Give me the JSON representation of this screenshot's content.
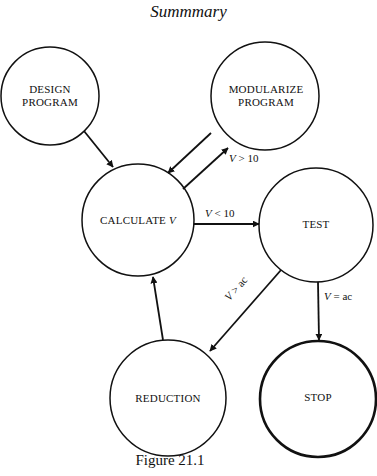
{
  "title": "Summmary",
  "caption": "Figure 21.1",
  "colors": {
    "stroke": "#111111",
    "background": "#ffffff"
  },
  "nodes": [
    {
      "id": "design",
      "lines": [
        "DESIGN",
        "PROGRAM"
      ],
      "cx": 50,
      "cy": 96,
      "r": 49,
      "stroke_width": 1.5
    },
    {
      "id": "modularize",
      "lines": [
        "MODULARIZE",
        "PROGRAM"
      ],
      "cx": 265,
      "cy": 96,
      "r": 54,
      "stroke_width": 1.5
    },
    {
      "id": "calculate",
      "lines": [
        "CALCULATE V"
      ],
      "cx": 138,
      "cy": 220,
      "r": 56,
      "stroke_width": 1.5
    },
    {
      "id": "test",
      "lines": [
        "TEST"
      ],
      "cx": 316,
      "cy": 225,
      "r": 57,
      "stroke_width": 1.5
    },
    {
      "id": "reduction",
      "lines": [
        "REDUCTION"
      ],
      "cx": 168,
      "cy": 398,
      "r": 58,
      "stroke_width": 1.5
    },
    {
      "id": "stop",
      "lines": [
        "STOP"
      ],
      "cx": 318,
      "cy": 399,
      "r": 58,
      "stroke_width": 2.6
    }
  ],
  "edges": [
    {
      "from": "design",
      "to": "calculate",
      "label": "",
      "x1": 84,
      "y1": 131,
      "x2": 113,
      "y2": 167
    },
    {
      "from": "modularize",
      "to": "calculate",
      "label": "",
      "x1": 211,
      "y1": 133,
      "x2": 168,
      "y2": 173
    },
    {
      "from": "calculate",
      "to": "modularize",
      "label": "V > 10",
      "x1": 183,
      "y1": 189,
      "x2": 228,
      "y2": 148
    },
    {
      "from": "calculate",
      "to": "test",
      "label": "V < 10",
      "x1": 194,
      "y1": 224,
      "x2": 259,
      "y2": 224
    },
    {
      "from": "test",
      "to": "reduction",
      "label": "V > ac",
      "x1": 281,
      "y1": 270,
      "x2": 210,
      "y2": 351
    },
    {
      "from": "test",
      "to": "stop",
      "label": "V = ac",
      "x1": 318,
      "y1": 282,
      "x2": 319,
      "y2": 340
    },
    {
      "from": "reduction",
      "to": "calculate",
      "label": "",
      "x1": 163,
      "y1": 340,
      "x2": 153,
      "y2": 277
    }
  ],
  "edge_labels": {
    "v_gt_10": {
      "var": "V",
      "op": " > 10"
    },
    "v_lt_10": {
      "var": "V",
      "op": " < 10"
    },
    "v_gt_ac": {
      "var": "V",
      "op": " > ac"
    },
    "v_eq_ac": {
      "var": "V",
      "op": " = ac"
    }
  },
  "node_text": {
    "design_1": "DESIGN",
    "design_2": "PROGRAM",
    "modularize_1": "MODULARIZE",
    "modularize_2": "PROGRAM",
    "calculate": "CALCULATE ",
    "calculate_var": "V",
    "test": "TEST",
    "reduction": "REDUCTION",
    "stop": "STOP"
  }
}
